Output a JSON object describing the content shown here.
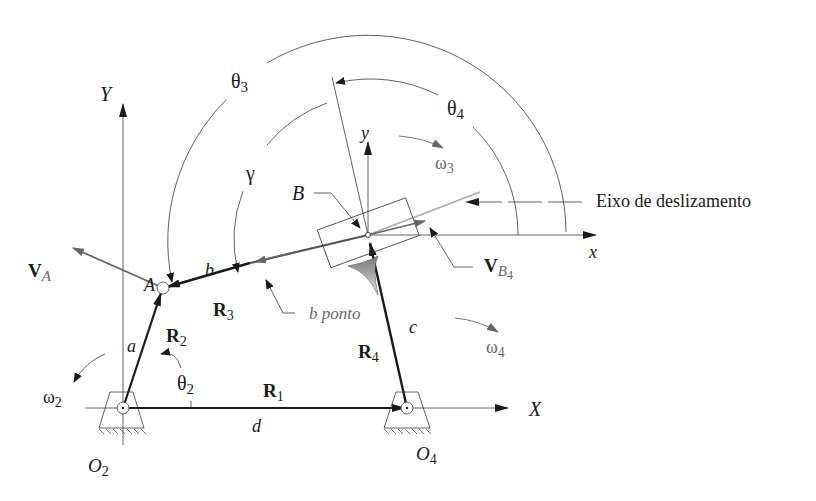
{
  "diagram": {
    "colors": {
      "line": "#1a1a1a",
      "thin": "#3a3a3a",
      "velocity": "#666666",
      "axis_light": "#aaaaaa",
      "shade": "#888888"
    },
    "labels": {
      "Y": "Y",
      "X": "X",
      "y": "y",
      "x": "x",
      "theta3": "θ",
      "theta3_sub": "3",
      "theta4": "θ",
      "theta4_sub": "4",
      "theta2": "θ",
      "theta2_sub": "2",
      "gamma": "γ",
      "omega3": "ω",
      "omega3_sub": "3",
      "omega4": "ω",
      "omega4_sub": "4",
      "omega2": "ω",
      "omega2_sub": "2",
      "B": "B",
      "A": "A",
      "b": "b",
      "a": "a",
      "c": "c",
      "d": "d",
      "R1": "R",
      "R1_sub": "1",
      "R2": "R",
      "R2_sub": "2",
      "R3": "R",
      "R3_sub": "3",
      "R4": "R",
      "R4_sub": "4",
      "VA": "V",
      "VA_sub": "A",
      "VB4": "V",
      "VB4_sub": "B",
      "VB4_subsub": "4",
      "O2": "O",
      "O2_sub": "2",
      "O4": "O",
      "O4_sub": "4",
      "b_ponto": "b ponto",
      "eixo": "Eixo de deslizamento"
    },
    "points": {
      "O2": [
        123,
        408
      ],
      "O4": [
        407,
        408
      ],
      "A": [
        163,
        287
      ],
      "B": [
        368,
        235
      ]
    }
  }
}
